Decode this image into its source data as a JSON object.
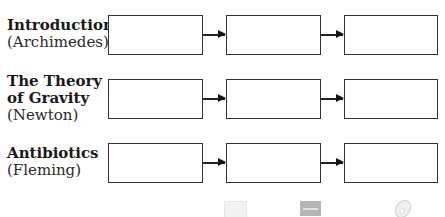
{
  "rows": [
    {
      "title": "Introduction",
      "subtitle": "(Archimedes)"
    },
    {
      "title_line1": "The Theory",
      "title_line2": "of Gravity",
      "subtitle": "(Newton)"
    },
    {
      "title": "Antibiotics",
      "subtitle": "(Fleming)"
    }
  ],
  "footer_icons": [
    "blank-note-icon",
    "notebook-icon",
    "cd-disc-icon"
  ],
  "colors": {
    "box_border": "#333333",
    "arrow": "#222222",
    "text": "#1a1a1a"
  }
}
